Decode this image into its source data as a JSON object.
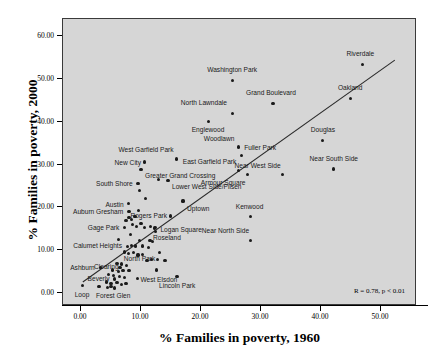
{
  "chart_data": {
    "type": "scatter",
    "title": "",
    "xlabel": "% Families in poverty, 1960",
    "ylabel": "% Families in poverty, 2000",
    "xlim": [
      -3,
      56
    ],
    "ylim": [
      -3,
      64
    ],
    "xticks": [
      "0.00",
      "10.00",
      "20.00",
      "30.00",
      "40.00",
      "50.00"
    ],
    "xtickvals": [
      0,
      10,
      20,
      30,
      40,
      50
    ],
    "yticks": [
      "0.00",
      "10.00",
      "20.00",
      "30.00",
      "40.00",
      "50.00",
      "60.00"
    ],
    "ytickvals": [
      0,
      10,
      20,
      30,
      40,
      50,
      60
    ],
    "grid": false,
    "legend": "none",
    "annotation": "R = 0.78, p < 0.01",
    "trendline": {
      "x0": 0.3,
      "y0": 2.6,
      "x1": 52.3,
      "y1": 54.4
    },
    "points": [
      {
        "label": "Riverdale",
        "x": 46.9,
        "y": 53.4,
        "lx": -2,
        "ly": -10,
        "anchor": "middle"
      },
      {
        "label": "Washington Park",
        "x": 25.2,
        "y": 49.6,
        "lx": 0,
        "ly": -10,
        "anchor": "middle"
      },
      {
        "label": "Oakland",
        "x": 44.9,
        "y": 45.4,
        "lx": 0,
        "ly": -10,
        "anchor": "middle"
      },
      {
        "label": "Grand Boulevard",
        "x": 32.0,
        "y": 44.3,
        "lx": -2,
        "ly": -10,
        "anchor": "middle"
      },
      {
        "label": "North Lawndale",
        "x": 25.3,
        "y": 42.0,
        "lx": -6,
        "ly": -10,
        "anchor": "end"
      },
      {
        "label": "Englewood",
        "x": 21.2,
        "y": 40.1,
        "lx": 0,
        "ly": 9,
        "anchor": "middle"
      },
      {
        "label": "Douglas",
        "x": 40.3,
        "y": 35.6,
        "lx": 0,
        "ly": -10,
        "anchor": "middle"
      },
      {
        "label": "Woodlawn",
        "x": 26.3,
        "y": 34.1,
        "lx": -4,
        "ly": -8,
        "anchor": "end"
      },
      {
        "label": "Fuller Park",
        "x": 26.7,
        "y": 32.2,
        "lx": 3,
        "ly": -7,
        "anchor": "start"
      },
      {
        "label": "West Garfield Park",
        "x": 15.9,
        "y": 31.3,
        "lx": -3,
        "ly": -9,
        "anchor": "end"
      },
      {
        "label": "New City",
        "x": 10.6,
        "y": 30.6,
        "lx": -4,
        "ly": 1,
        "anchor": "end"
      },
      {
        "label": "Near South Side",
        "x": 42.1,
        "y": 29.0,
        "lx": 0,
        "ly": -9,
        "anchor": "middle"
      },
      {
        "label": "East Garfield Park",
        "x": 26.3,
        "y": 28.6,
        "lx": -2,
        "ly": -8,
        "anchor": "end"
      },
      {
        "label": "Greater Grand Crossing",
        "x": 10.0,
        "y": 28.8,
        "lx": 4,
        "ly": 7,
        "anchor": "start"
      },
      {
        "label": "Near West Side",
        "x": 33.6,
        "y": 27.7,
        "lx": -2,
        "ly": -8,
        "anchor": "end"
      },
      {
        "label": "Armour Square",
        "x": 27.8,
        "y": 27.7,
        "lx": -2,
        "ly": 9,
        "anchor": "end"
      },
      {
        "label": "Lower West Side/Pilsen",
        "x": 14.5,
        "y": 26.3,
        "lx": 4,
        "ly": 7,
        "anchor": "start"
      },
      {
        "label": "South Shore",
        "x": 9.5,
        "y": 25.6,
        "lx": -5,
        "ly": 1,
        "anchor": "end"
      },
      {
        "label": "Uptown",
        "x": 17.0,
        "y": 21.5,
        "lx": 4,
        "ly": 8,
        "anchor": "start"
      },
      {
        "label": "Austin",
        "x": 7.9,
        "y": 20.9,
        "lx": -5,
        "ly": 2,
        "anchor": "end"
      },
      {
        "label": "Kenwood",
        "x": 28.3,
        "y": 17.8,
        "lx": -1,
        "ly": -9,
        "anchor": "middle"
      },
      {
        "label": "Auburn Gresham",
        "x": 8.0,
        "y": 19.0,
        "lx": -6,
        "ly": 1,
        "anchor": "end"
      },
      {
        "label": "Rogers Park",
        "x": 14.9,
        "y": 18.0,
        "lx": -3,
        "ly": 0,
        "anchor": "end"
      },
      {
        "label": "Logan Square",
        "x": 12.4,
        "y": 15.4,
        "lx": 5,
        "ly": 3,
        "anchor": "start"
      },
      {
        "label": "Gage Park",
        "x": 7.3,
        "y": 15.3,
        "lx": -5,
        "ly": 1,
        "anchor": "end"
      },
      {
        "label": "Roseland",
        "x": 11.5,
        "y": 12.3,
        "lx": 3,
        "ly": -2,
        "anchor": "start"
      },
      {
        "label": "Near North Side",
        "x": 28.3,
        "y": 12.3,
        "lx": -2,
        "ly": -9,
        "anchor": "end"
      },
      {
        "label": "Calumet Heights",
        "x": 7.7,
        "y": 10.8,
        "lx": -5,
        "ly": 0,
        "anchor": "end"
      },
      {
        "label": "North Park",
        "x": 12.8,
        "y": 7.8,
        "lx": -2,
        "ly": 0,
        "anchor": "end"
      },
      {
        "label": "Clearing",
        "x": 6.5,
        "y": 6.0,
        "lx": -1,
        "ly": 0,
        "anchor": "end"
      },
      {
        "label": "Ashburn",
        "x": 3.2,
        "y": 5.9,
        "lx": -5,
        "ly": 1,
        "anchor": "end"
      },
      {
        "label": "West Elsdon",
        "x": 9.4,
        "y": 3.5,
        "lx": 3,
        "ly": 2,
        "anchor": "start"
      },
      {
        "label": "Beverly",
        "x": 5.6,
        "y": 3.3,
        "lx": -5,
        "ly": 0,
        "anchor": "end"
      },
      {
        "label": "Lincoln Park",
        "x": 16.0,
        "y": 3.8,
        "lx": 0,
        "ly": 10,
        "anchor": "middle"
      },
      {
        "label": "Forest Glen",
        "x": 5.0,
        "y": 1.5,
        "lx": 2,
        "ly": 10,
        "anchor": "middle"
      },
      {
        "label": "Loop",
        "x": 0.2,
        "y": 1.7,
        "lx": 0,
        "ly": 10,
        "anchor": "middle"
      }
    ],
    "unlabeled_points": [
      {
        "x": 9.7,
        "y": 24.0
      },
      {
        "x": 10.7,
        "y": 22.0
      },
      {
        "x": 12.9,
        "y": 26.5
      },
      {
        "x": 8.0,
        "y": 17.6
      },
      {
        "x": 8.4,
        "y": 17.2
      },
      {
        "x": 7.5,
        "y": 16.9
      },
      {
        "x": 9.0,
        "y": 17.9
      },
      {
        "x": 8.6,
        "y": 16.0
      },
      {
        "x": 9.3,
        "y": 15.6
      },
      {
        "x": 10.0,
        "y": 16.2
      },
      {
        "x": 10.6,
        "y": 15.3
      },
      {
        "x": 11.6,
        "y": 15.5
      },
      {
        "x": 12.2,
        "y": 15.2
      },
      {
        "x": 12.4,
        "y": 14.3
      },
      {
        "x": 6.3,
        "y": 12.5
      },
      {
        "x": 8.4,
        "y": 11.1
      },
      {
        "x": 9.1,
        "y": 11.0
      },
      {
        "x": 9.8,
        "y": 12.3
      },
      {
        "x": 10.3,
        "y": 11.0
      },
      {
        "x": 11.2,
        "y": 10.6
      },
      {
        "x": 11.9,
        "y": 12.0
      },
      {
        "x": 7.2,
        "y": 9.6
      },
      {
        "x": 7.9,
        "y": 9.3
      },
      {
        "x": 8.7,
        "y": 9.4
      },
      {
        "x": 9.5,
        "y": 8.9
      },
      {
        "x": 10.2,
        "y": 9.0
      },
      {
        "x": 13.1,
        "y": 9.5
      },
      {
        "x": 11.0,
        "y": 7.6
      },
      {
        "x": 11.7,
        "y": 7.9
      },
      {
        "x": 14.0,
        "y": 7.6
      },
      {
        "x": 6.0,
        "y": 7.0
      },
      {
        "x": 6.8,
        "y": 6.8
      },
      {
        "x": 7.6,
        "y": 6.4
      },
      {
        "x": 5.2,
        "y": 5.4
      },
      {
        "x": 6.2,
        "y": 5.0
      },
      {
        "x": 7.0,
        "y": 5.2
      },
      {
        "x": 8.0,
        "y": 5.3
      },
      {
        "x": 12.6,
        "y": 5.4
      },
      {
        "x": 4.6,
        "y": 4.3
      },
      {
        "x": 5.4,
        "y": 4.1
      },
      {
        "x": 6.4,
        "y": 3.9
      },
      {
        "x": 7.2,
        "y": 3.6
      },
      {
        "x": 4.2,
        "y": 2.6
      },
      {
        "x": 5.0,
        "y": 2.3
      },
      {
        "x": 6.0,
        "y": 2.4
      },
      {
        "x": 6.8,
        "y": 2.0
      },
      {
        "x": 7.5,
        "y": 2.2
      },
      {
        "x": 4.4,
        "y": 1.3
      },
      {
        "x": 5.6,
        "y": 1.2
      },
      {
        "x": 3.0,
        "y": 1.6
      },
      {
        "x": 8.3,
        "y": 13.6
      },
      {
        "x": 9.6,
        "y": 19.3
      }
    ]
  },
  "colors": {
    "panel_bg": "#d6d6d6",
    "point": "#1a1a1a",
    "line": "#2b2b2b",
    "frame": "#3a3a3a"
  }
}
